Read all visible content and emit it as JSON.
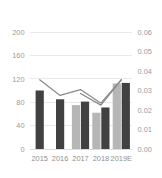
{
  "chart_data": {
    "type": "bar",
    "title": "",
    "subtitle": "",
    "xlabel": "",
    "ylabel": "",
    "categories": [
      "2015",
      "2016",
      "2017",
      "2018",
      "2019E"
    ],
    "grid": true,
    "legend_position": "none",
    "axes": {
      "left": {
        "ticks": [
          "0",
          "40",
          "80",
          "120",
          "160",
          "200"
        ],
        "tick_values": [
          0,
          40,
          80,
          120,
          160,
          200
        ],
        "ylim": [
          0,
          200
        ],
        "label": ""
      },
      "right": {
        "ticks": [
          "0.00",
          "0.01",
          "0.02",
          "0.03",
          "0.04",
          "0.05",
          "0.06"
        ],
        "tick_values": [
          0.0,
          0.01,
          0.02,
          0.03,
          0.04,
          0.05,
          0.06
        ],
        "ylim": [
          0.0,
          0.06
        ],
        "label": ""
      }
    },
    "series": [
      {
        "name": "bar-series-light",
        "type": "bar",
        "axis": "left",
        "color": "#b6b6b6",
        "values": [
          null,
          null,
          75,
          62,
          112
        ]
      },
      {
        "name": "bar-series-dark",
        "type": "bar",
        "axis": "left",
        "color": "#414141",
        "values": [
          100,
          85,
          81,
          71,
          113
        ]
      },
      {
        "name": "line-series-1",
        "type": "line",
        "axis": "right",
        "color": "#8a8a8a",
        "values": [
          0.0355,
          0.0275,
          0.0305,
          0.0235,
          0.0355
        ]
      },
      {
        "name": "line-series-2",
        "type": "line",
        "axis": "right",
        "color": "#8a8a8a",
        "values": [
          null,
          null,
          0.0285,
          0.0225,
          0.0355
        ]
      }
    ]
  },
  "colors": {
    "bar_light": "#b6b6b6",
    "bar_dark": "#414141",
    "line": "#8a8a8a",
    "gridline": "#e4e4e4",
    "tick_text": "#9b9b9b",
    "background": "#ffffff"
  }
}
